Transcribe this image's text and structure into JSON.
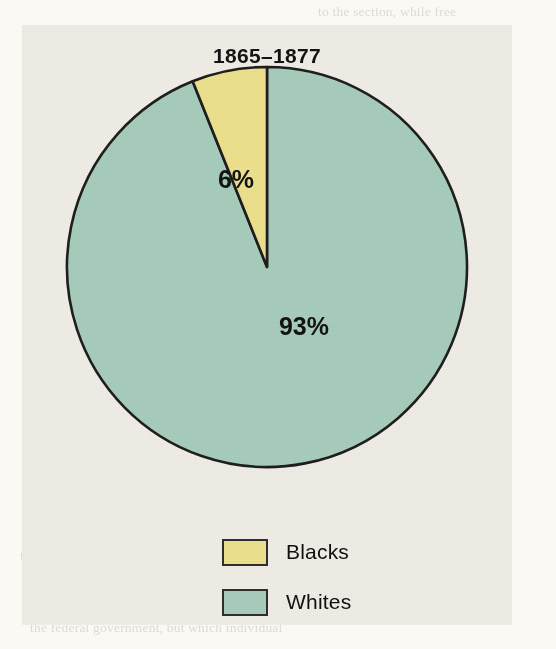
{
  "chart_data": {
    "type": "pie",
    "title": "1865–1877",
    "categories": [
      "Blacks",
      "Whites"
    ],
    "values": [
      6,
      93
    ],
    "value_labels": [
      "6%",
      "93%"
    ],
    "colors": [
      "#EDE08E",
      "#A8CCBC"
    ],
    "xlabel": "",
    "ylabel": "",
    "legend_position": "bottom",
    "grid": false,
    "start_angle_deg": 90,
    "direction": "counterclockwise",
    "outline_color": "#1E1E1E"
  },
  "panel": {
    "background": "#EFEDE5"
  },
  "page": {
    "background": "#FBF9F4",
    "ghost_lines": [
      {
        "text": "to the section, while free",
        "x": 318,
        "y": 4
      },
      {
        "text": "ere to condemn it when it came to violence against the",
        "x": 28,
        "y": 28
      },
      {
        "text": "of the freedmen. But that was not the case in 1871. On",
        "x": 38,
        "y": 52
      },
      {
        "text": "of Sumner and Charles Francis Adams of Massachusetts, pro-",
        "x": 24,
        "y": 76
      },
      {
        "text": "his bankrupt policies. Most Liberal Republicans had lost",
        "x": 36,
        "y": 100
      },
      {
        "text": "in the late 1860s over the Fourteenth Amendment, which they",
        "x": 22,
        "y": 124
      },
      {
        "text": "was radical. Their plan was to deny Grant a second term by",
        "x": 34,
        "y": 148
      },
      {
        "text": "for the presidency with the Democrats in 1872.",
        "x": 40,
        "y": 172
      },
      {
        "text": "a Liberal candidate",
        "x": 88,
        "y": 196
      },
      {
        "text": "ng. Moreover, support for Reconstruction was never as strong",
        "x": 26,
        "y": 272
      },
      {
        "text": "egan to wane as the public grew tired of the issue and as",
        "x": 32,
        "y": 296
      },
      {
        "text": "noted, but the commitment of Republicans to the",
        "x": 44,
        "y": 320
      },
      {
        "text": "the Klan's activities in the South were",
        "x": 20,
        "y": 548
      },
      {
        "text": "on matters that had nothing to do with the freedmen",
        "x": 28,
        "y": 572
      },
      {
        "text": "that the Ku Klux Klan is a secret",
        "x": 36,
        "y": 596
      },
      {
        "text": "the federal government, but which individual",
        "x": 30,
        "y": 620
      }
    ]
  }
}
